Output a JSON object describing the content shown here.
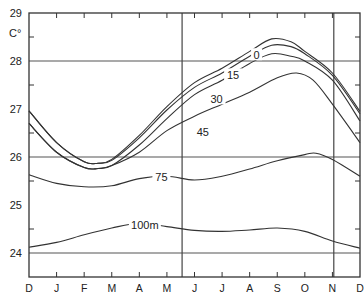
{
  "chart_data": {
    "type": "line",
    "title": "",
    "xlabel": "",
    "ylabel": "C°",
    "ylim": [
      23.5,
      29
    ],
    "yticks": [
      24,
      25,
      26,
      27,
      28,
      29
    ],
    "grid_lines_y": [
      24,
      26,
      28
    ],
    "vertical_lines_x_month": [
      5.55,
      11.05
    ],
    "x_tick_labels": [
      "D",
      "J",
      "F",
      "M",
      "A",
      "M",
      "J",
      "J",
      "A",
      "S",
      "O",
      "N",
      "D"
    ],
    "x_positions": [
      0,
      1,
      2,
      3,
      4,
      5,
      6,
      7,
      8,
      9,
      10,
      11,
      12
    ],
    "series": [
      {
        "name": "0",
        "label": "0",
        "x": [
          0,
          1,
          2,
          2.5,
          3,
          4,
          5,
          6,
          7,
          8,
          8.8,
          9.5,
          10,
          11,
          12
        ],
        "values": [
          26.96,
          26.3,
          25.9,
          25.87,
          25.95,
          26.45,
          27.05,
          27.55,
          27.85,
          28.2,
          28.46,
          28.4,
          28.2,
          27.75,
          26.95
        ]
      },
      {
        "name": "15",
        "label": "15",
        "x": [
          0,
          1,
          2,
          2.5,
          3,
          4,
          5,
          6,
          7,
          8,
          8.8,
          9.5,
          10,
          11,
          12
        ],
        "values": [
          26.96,
          26.3,
          25.9,
          25.87,
          25.93,
          26.4,
          26.98,
          27.45,
          27.75,
          28.1,
          28.33,
          28.3,
          28.15,
          27.7,
          26.9
        ]
      },
      {
        "name": "30",
        "label": "30",
        "x": [
          0,
          1,
          2,
          2.5,
          3,
          4,
          5,
          6,
          7,
          8,
          8.8,
          9.5,
          10,
          11,
          12
        ],
        "values": [
          26.7,
          26.1,
          25.78,
          25.76,
          25.82,
          26.25,
          26.8,
          27.3,
          27.6,
          27.95,
          28.15,
          28.1,
          28.0,
          27.6,
          26.75
        ]
      },
      {
        "name": "45",
        "label": "45",
        "x": [
          0,
          1,
          2,
          2.5,
          3,
          4,
          5,
          6,
          7,
          8,
          9,
          9.7,
          10.3,
          11,
          12
        ],
        "values": [
          26.7,
          26.1,
          25.78,
          25.76,
          25.82,
          26.1,
          26.55,
          26.85,
          27.1,
          27.35,
          27.65,
          27.75,
          27.6,
          27.1,
          26.3
        ]
      },
      {
        "name": "75",
        "label": "75",
        "x": [
          0,
          1,
          2,
          3,
          4,
          5,
          6,
          7,
          8,
          9,
          10,
          10.4,
          11,
          12
        ],
        "values": [
          25.63,
          25.45,
          25.38,
          25.4,
          25.55,
          25.6,
          25.52,
          25.6,
          25.75,
          25.92,
          26.05,
          26.08,
          25.95,
          25.6
        ]
      },
      {
        "name": "100m",
        "label": "100m",
        "x": [
          0,
          1,
          2,
          3,
          4,
          5,
          6,
          7,
          8,
          9,
          10,
          11,
          12
        ],
        "values": [
          24.12,
          24.22,
          24.38,
          24.52,
          24.62,
          24.55,
          24.47,
          24.45,
          24.48,
          24.52,
          24.45,
          24.25,
          24.1
        ]
      }
    ],
    "annotations": [
      {
        "text": "0",
        "x": 8.25,
        "y": 28.12
      },
      {
        "text": "15",
        "x": 7.4,
        "y": 27.7
      },
      {
        "text": "30",
        "x": 6.8,
        "y": 27.2
      },
      {
        "text": "45",
        "x": 6.3,
        "y": 26.52
      },
      {
        "text": "75",
        "x": 4.8,
        "y": 25.58
      },
      {
        "text": "100m",
        "x": 4.2,
        "y": 24.58
      }
    ],
    "legend": "none (inline contour labels)"
  }
}
